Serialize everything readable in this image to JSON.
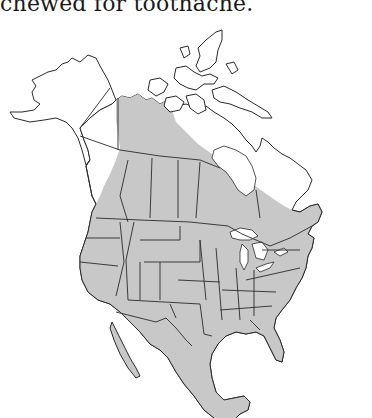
{
  "caption": "chewed for toothache.",
  "map": {
    "type": "range-map",
    "region": "North America",
    "legend": [],
    "colors": {
      "range_fill": "#c8c8c8",
      "land_fill": "#ffffff",
      "outline": "#2a2a2a",
      "background": "#ffffff"
    },
    "range_description": "Shaded from Yukon/British Columbia diagonally across boreal Canada to Quebec and New England, covering the contiguous United States and Mexico"
  }
}
